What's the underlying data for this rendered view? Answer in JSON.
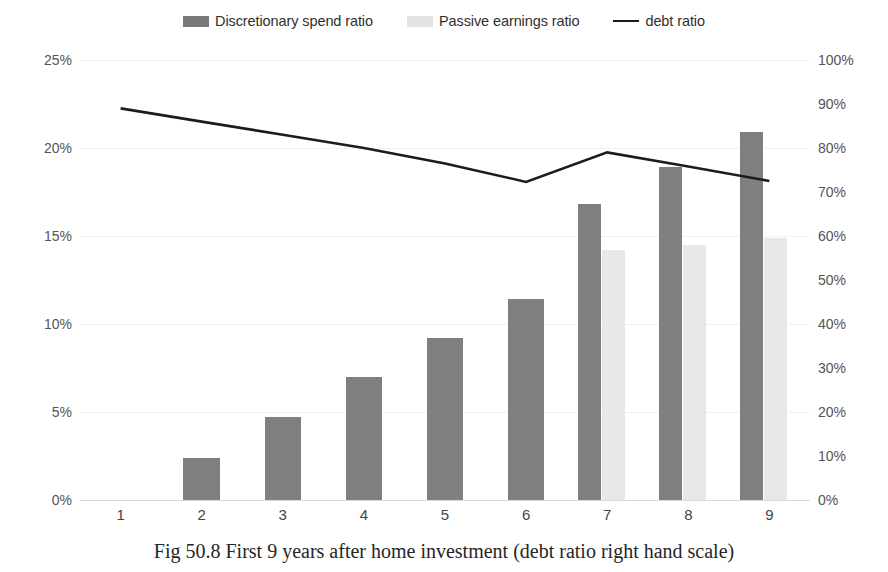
{
  "legend": {
    "items": [
      {
        "label": "Discretionary spend ratio",
        "marker": "dark-swatch-icon",
        "color": "#7f7f7f"
      },
      {
        "label": "Passive earnings ratio",
        "marker": "light-swatch-icon",
        "color": "#e8e8e8"
      },
      {
        "label": "debt ratio",
        "marker": "line-marker-icon",
        "color": "#1c1c1c"
      }
    ]
  },
  "caption": {
    "text": "Fig 50.8 First 9 years after home investment (debt ratio right hand scale)"
  },
  "axes": {
    "left_ticks": [
      "0%",
      "5%",
      "10%",
      "15%",
      "20%",
      "25%"
    ],
    "right_ticks": [
      "0%",
      "10%",
      "20%",
      "30%",
      "40%",
      "50%",
      "60%",
      "70%",
      "80%",
      "90%",
      "100%"
    ],
    "x_ticks": [
      "1",
      "2",
      "3",
      "4",
      "5",
      "6",
      "7",
      "8",
      "9"
    ]
  },
  "chart_data": {
    "type": "bar",
    "title": "",
    "subtitle": "",
    "xlabel": "",
    "ylabel": "",
    "y2label": "",
    "categories": [
      "1",
      "2",
      "3",
      "4",
      "5",
      "6",
      "7",
      "8",
      "9"
    ],
    "series": [
      {
        "name": "Discretionary spend ratio",
        "type": "bar",
        "axis": "left",
        "color": "#7f7f7f",
        "values": [
          0,
          2.4,
          4.7,
          7.0,
          9.2,
          11.4,
          16.8,
          18.9,
          20.9
        ]
      },
      {
        "name": "Passive earnings ratio",
        "type": "bar",
        "axis": "left",
        "color": "#e8e8e8",
        "values": [
          0,
          0,
          0,
          0,
          0,
          0,
          14.2,
          14.5,
          14.9
        ]
      },
      {
        "name": "debt ratio",
        "type": "line",
        "axis": "right",
        "color": "#1c1c1c",
        "values": [
          89.0,
          86.0,
          83.0,
          80.0,
          76.5,
          72.3,
          79.0,
          75.8,
          72.5
        ]
      }
    ],
    "ylim": [
      0,
      25
    ],
    "y2lim": [
      0,
      100
    ],
    "ytick_interval": 5,
    "y2tick_interval": 10,
    "grid": true,
    "legend_position": "top"
  }
}
